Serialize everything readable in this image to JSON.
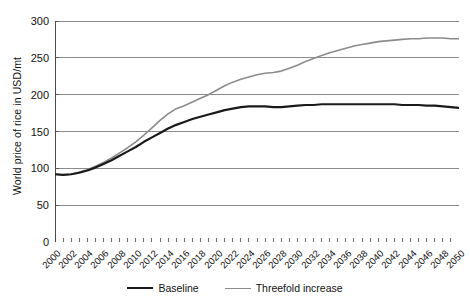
{
  "chart_data": {
    "type": "line",
    "title": "",
    "xlabel": "",
    "ylabel": "World price of rice in USD/mt",
    "ylim": [
      0,
      300
    ],
    "yticks": [
      0,
      50,
      100,
      150,
      200,
      250,
      300
    ],
    "xlim": [
      2000,
      2050
    ],
    "grid": "horizontal",
    "legend_position": "bottom-center",
    "categories": [
      2000,
      2001,
      2002,
      2003,
      2004,
      2005,
      2006,
      2007,
      2008,
      2009,
      2010,
      2011,
      2012,
      2013,
      2014,
      2015,
      2016,
      2017,
      2018,
      2019,
      2020,
      2021,
      2022,
      2023,
      2024,
      2025,
      2026,
      2027,
      2028,
      2029,
      2030,
      2031,
      2032,
      2033,
      2034,
      2035,
      2036,
      2037,
      2038,
      2039,
      2040,
      2041,
      2042,
      2043,
      2044,
      2045,
      2046,
      2047,
      2048,
      2049,
      2050
    ],
    "xtick_labels": [
      "2000",
      "2002",
      "2004",
      "2006",
      "2008",
      "2010",
      "2012",
      "2014",
      "2016",
      "2018",
      "2020",
      "2022",
      "2024",
      "2026",
      "2028",
      "2030",
      "2032",
      "2034",
      "2036",
      "2038",
      "2040",
      "2042",
      "2044",
      "2046",
      "2048",
      "2050"
    ],
    "series": [
      {
        "name": "Baseline",
        "color": "#1a1a1a",
        "width": 2.2,
        "values": [
          92,
          91,
          92,
          94,
          97,
          101,
          106,
          111,
          117,
          123,
          129,
          136,
          142,
          148,
          154,
          159,
          163,
          167,
          170,
          173,
          176,
          179,
          181,
          183,
          184,
          184,
          184,
          183,
          183,
          184,
          185,
          186,
          186,
          187,
          187,
          187,
          187,
          187,
          187,
          187,
          187,
          187,
          187,
          186,
          186,
          186,
          185,
          185,
          184,
          183,
          182
        ]
      },
      {
        "name": "Threefold increase",
        "color": "#8b8b8b",
        "width": 1.6,
        "values": [
          92,
          91,
          92,
          95,
          98,
          103,
          108,
          114,
          121,
          128,
          136,
          145,
          155,
          165,
          174,
          181,
          185,
          190,
          195,
          200,
          206,
          212,
          217,
          221,
          224,
          227,
          229,
          230,
          232,
          236,
          240,
          245,
          249,
          253,
          257,
          260,
          263,
          266,
          268,
          270,
          272,
          273,
          274,
          275,
          276,
          276,
          277,
          277,
          277,
          276,
          276
        ]
      }
    ]
  },
  "axes": {
    "ytick_labels": [
      "300",
      "250",
      "200",
      "150",
      "100",
      "50",
      "0"
    ]
  },
  "legend": {
    "items": [
      {
        "label": "Baseline",
        "swatch": "baseline-line-swatch"
      },
      {
        "label": "Threefold increase",
        "swatch": "threefold-line-swatch"
      }
    ]
  }
}
